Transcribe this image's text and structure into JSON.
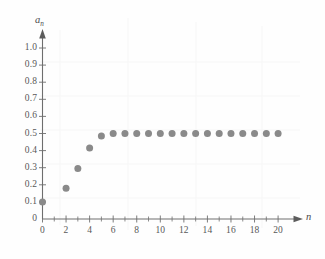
{
  "chart_data": {
    "type": "scatter",
    "title": "",
    "subtitle": "",
    "xlabel": "n",
    "ylabel": "a_n",
    "ylabel_base": "a",
    "ylabel_sub": "n",
    "xlim": [
      0,
      20.8
    ],
    "ylim": [
      0,
      1.05
    ],
    "grid": false,
    "legend": null,
    "point_color": "#8a8a8a",
    "axis_color": "#6e6e6e",
    "x_tick_labels": [
      "0",
      "2",
      "4",
      "6",
      "8",
      "10",
      "12",
      "14",
      "16",
      "18",
      "20"
    ],
    "x_tick_values": [
      0,
      2,
      4,
      6,
      8,
      10,
      12,
      14,
      16,
      18,
      20
    ],
    "x_minor_ticks": [
      1,
      3,
      5,
      7,
      9,
      11,
      13,
      15,
      17,
      19
    ],
    "y_tick_labels": [
      "0",
      "0.1",
      "0.2",
      "0.3",
      "0.4",
      "0.5",
      "0.6",
      "0.7",
      "0.8",
      "0.9",
      "1.0"
    ],
    "y_tick_values": [
      0,
      0.1,
      0.2,
      0.3,
      0.4,
      0.5,
      0.6,
      0.7,
      0.8,
      0.9,
      1.0
    ],
    "x": [
      0,
      2,
      3,
      4,
      5,
      6,
      7,
      8,
      9,
      10,
      11,
      12,
      13,
      14,
      15,
      16,
      17,
      18,
      19,
      20
    ],
    "values": [
      0.1,
      0.18,
      0.295,
      0.415,
      0.485,
      0.5,
      0.5,
      0.5,
      0.5,
      0.5,
      0.5,
      0.5,
      0.5,
      0.5,
      0.5,
      0.5,
      0.5,
      0.5,
      0.5,
      0.5
    ],
    "series": [
      {
        "name": "a_n",
        "points": [
          {
            "x": 0,
            "y": 0.1
          },
          {
            "x": 2,
            "y": 0.18
          },
          {
            "x": 3,
            "y": 0.295
          },
          {
            "x": 4,
            "y": 0.415
          },
          {
            "x": 5,
            "y": 0.485
          },
          {
            "x": 6,
            "y": 0.5
          },
          {
            "x": 7,
            "y": 0.5
          },
          {
            "x": 8,
            "y": 0.5
          },
          {
            "x": 9,
            "y": 0.5
          },
          {
            "x": 10,
            "y": 0.5
          },
          {
            "x": 11,
            "y": 0.5
          },
          {
            "x": 12,
            "y": 0.5
          },
          {
            "x": 13,
            "y": 0.5
          },
          {
            "x": 14,
            "y": 0.5
          },
          {
            "x": 15,
            "y": 0.5
          },
          {
            "x": 16,
            "y": 0.5
          },
          {
            "x": 17,
            "y": 0.5
          },
          {
            "x": 18,
            "y": 0.5
          },
          {
            "x": 19,
            "y": 0.5
          },
          {
            "x": 20,
            "y": 0.5
          }
        ]
      }
    ]
  }
}
